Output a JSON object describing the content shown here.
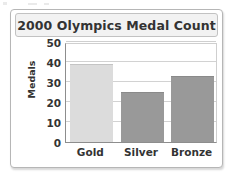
{
  "chart_data": {
    "type": "bar",
    "title": "2000 Olympics Medal Count",
    "xlabel": "",
    "ylabel": "Medals",
    "categories": [
      "Gold",
      "Silver",
      "Bronze"
    ],
    "values": [
      39,
      25,
      33
    ],
    "ylim": [
      0,
      50
    ],
    "yticks": [
      0,
      10,
      20,
      30,
      40,
      50
    ],
    "ytick_labels": [
      "0",
      "10",
      "20",
      "30",
      "40",
      "50"
    ],
    "grid": true,
    "legend": "none",
    "bar_colors": [
      "#dcdcdc",
      "#999999",
      "#999999"
    ],
    "bar_edge_colors": [
      "#c4c4c4",
      "#8a8a8a",
      "#8a8a8a"
    ],
    "series": [
      {
        "name": "Medals",
        "points": [
          {
            "category": "Gold",
            "value": 39
          },
          {
            "category": "Silver",
            "value": 25
          },
          {
            "category": "Bronze",
            "value": 33
          }
        ]
      }
    ]
  },
  "figure": {
    "title_text": "2000 Olympics Medal Count",
    "axis_title_y": "Medals"
  },
  "colors": {
    "card_border": "#b6b6b6",
    "title_plate_bg": "#f2f2f2",
    "title_plate_border": "#c2c2c2",
    "axis": "#8d8d8d",
    "gridline": "#d2d2d2",
    "text": "#333333",
    "gold_bar": "#dcdcdc",
    "silver_bar": "#999999",
    "bronze_bar": "#999999"
  }
}
